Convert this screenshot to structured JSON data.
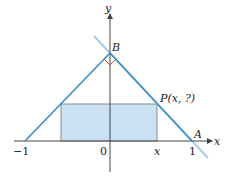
{
  "diagram": {
    "labels": {
      "y_axis": "y",
      "x_axis": "x",
      "point_B": "B",
      "point_A": "A",
      "point_P": "P(x, ?)",
      "tick_neg1": "−1",
      "tick_0": "0",
      "tick_x": "x",
      "tick_1": "1"
    },
    "colors": {
      "line": "#3b8ec8",
      "line_ext": "#a9cde6",
      "rect_fill": "#c9e1f3",
      "rect_stroke": "#8a8a8a",
      "axis": "#444444",
      "right_angle": "#b5542a"
    }
  }
}
